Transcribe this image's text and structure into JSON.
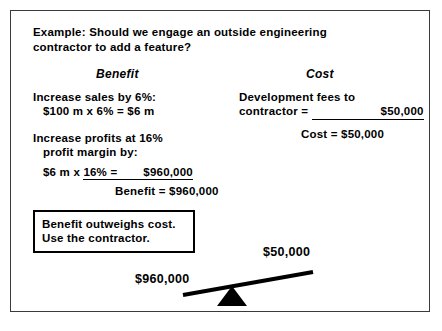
{
  "slide": {
    "prompt": {
      "line1": "Example:  Should we engage an outside engineering",
      "line2": "contractor to add a feature?"
    },
    "columns": {
      "benefit_header": "Benefit",
      "cost_header": "Cost"
    },
    "benefit": {
      "item1_line1": "Increase sales by 6%:",
      "item1_line2": "$100 m x 6% = $6 m",
      "item2_line1": "Increase profits at 16%",
      "item2_line2": "profit margin by:",
      "calc_prefix": "$6 m x ",
      "calc_underlined": "16% =",
      "calc_result": "$960,000",
      "total_label": "Benefit =",
      "total_value": "$960,000"
    },
    "cost": {
      "item1_line1": "Development fees to",
      "item1_line2_label": "contractor =",
      "item1_line2_value": "$50,000",
      "total_label": "Cost =",
      "total_value": "$50,000"
    },
    "conclusion": {
      "line1": "Benefit outweighs cost.",
      "line2": "Use the contractor."
    },
    "seesaw": {
      "left_label": "$960,000",
      "right_label": "$50,000"
    }
  },
  "colors": {
    "ink": "#000000",
    "page": "#ffffff",
    "frame": "#3a3a3a"
  }
}
